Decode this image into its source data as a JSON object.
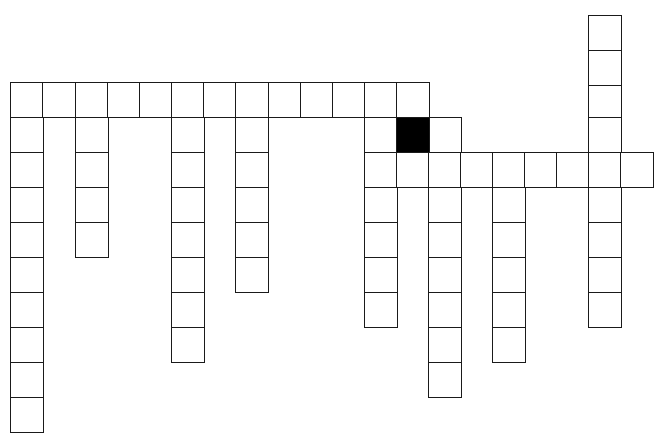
{
  "puzzle": {
    "type": "crossword-grid",
    "cell_width": 33,
    "cell_height": 35,
    "colors": {
      "cell": "#ffffff",
      "border": "#1a1a1a",
      "blocked": "#000000"
    },
    "cols_x": [
      10,
      42,
      75,
      107,
      139,
      171,
      203,
      235,
      268,
      300,
      332,
      364,
      396,
      428,
      460,
      492,
      524,
      556,
      588,
      620
    ],
    "rows_y": [
      15,
      50,
      85,
      120,
      155,
      190,
      225,
      260,
      295,
      330,
      365,
      400
    ],
    "cells": [
      [
        10,
        82
      ],
      [
        42,
        82
      ],
      [
        75,
        82
      ],
      [
        107,
        82
      ],
      [
        139,
        82
      ],
      [
        171,
        82
      ],
      [
        203,
        82
      ],
      [
        235,
        82
      ],
      [
        268,
        82
      ],
      [
        300,
        82
      ],
      [
        332,
        82
      ],
      [
        364,
        82
      ],
      [
        396,
        82
      ],
      [
        10,
        117
      ],
      [
        10,
        152
      ],
      [
        10,
        187
      ],
      [
        10,
        222
      ],
      [
        10,
        257
      ],
      [
        10,
        292
      ],
      [
        10,
        327
      ],
      [
        10,
        362
      ],
      [
        10,
        397
      ],
      [
        75,
        117
      ],
      [
        75,
        152
      ],
      [
        75,
        187
      ],
      [
        75,
        222
      ],
      [
        171,
        117
      ],
      [
        171,
        152
      ],
      [
        171,
        187
      ],
      [
        171,
        222
      ],
      [
        171,
        257
      ],
      [
        171,
        292
      ],
      [
        171,
        327
      ],
      [
        235,
        117
      ],
      [
        235,
        152
      ],
      [
        235,
        187
      ],
      [
        235,
        222
      ],
      [
        235,
        257
      ],
      [
        364,
        117
      ],
      [
        428,
        117
      ],
      [
        364,
        152
      ],
      [
        396,
        152
      ],
      [
        428,
        152
      ],
      [
        460,
        152
      ],
      [
        492,
        152
      ],
      [
        524,
        152
      ],
      [
        556,
        152
      ],
      [
        588,
        152
      ],
      [
        620,
        152
      ],
      [
        364,
        187
      ],
      [
        364,
        222
      ],
      [
        364,
        257
      ],
      [
        364,
        292
      ],
      [
        428,
        187
      ],
      [
        428,
        222
      ],
      [
        428,
        257
      ],
      [
        428,
        292
      ],
      [
        428,
        327
      ],
      [
        428,
        362
      ],
      [
        492,
        187
      ],
      [
        492,
        222
      ],
      [
        492,
        257
      ],
      [
        492,
        292
      ],
      [
        492,
        327
      ],
      [
        588,
        15
      ],
      [
        588,
        50
      ],
      [
        588,
        85
      ],
      [
        588,
        117
      ],
      [
        588,
        187
      ],
      [
        588,
        222
      ],
      [
        588,
        257
      ],
      [
        588,
        292
      ]
    ],
    "blocked_cells": [
      [
        396,
        117
      ]
    ]
  }
}
